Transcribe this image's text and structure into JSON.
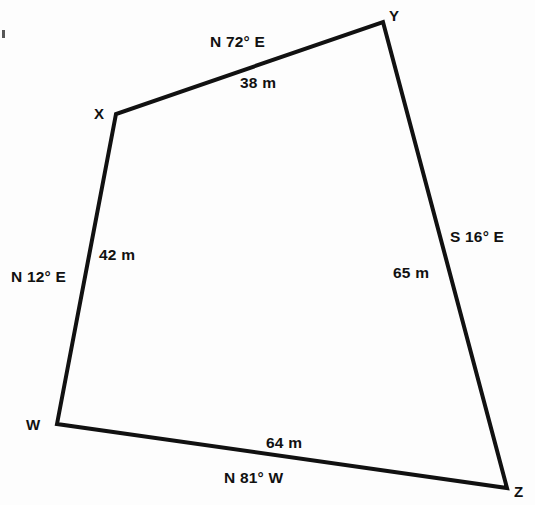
{
  "figure": {
    "background_color": "#fdfdfd",
    "line_color": "#111111",
    "line_width": 4,
    "vertices": [
      {
        "name": "W",
        "label": "W",
        "x": 57,
        "y": 424,
        "label_x": 26,
        "label_y": 417
      },
      {
        "name": "X",
        "label": "X",
        "x": 116,
        "y": 114,
        "label_x": 94,
        "label_y": 106
      },
      {
        "name": "Y",
        "label": "Y",
        "x": 383,
        "y": 22,
        "label_x": 389,
        "label_y": 8
      },
      {
        "name": "Z",
        "label": "Z",
        "x": 507,
        "y": 488,
        "label_x": 514,
        "label_y": 484
      }
    ],
    "edges": [
      {
        "name": "edge-xy",
        "from": "X",
        "to": "Y",
        "bearing": "N 72° E",
        "distance": "38 m",
        "bearing_x": 210,
        "bearing_y": 34,
        "distance_x": 240,
        "distance_y": 75
      },
      {
        "name": "edge-yz",
        "from": "Y",
        "to": "Z",
        "bearing": "S 16° E",
        "distance": "65 m",
        "bearing_x": 450,
        "bearing_y": 229,
        "distance_x": 393,
        "distance_y": 265
      },
      {
        "name": "edge-wz",
        "from": "W",
        "to": "Z",
        "bearing": "N 81° W",
        "distance": "64 m",
        "bearing_x": 224,
        "bearing_y": 470,
        "distance_x": 266,
        "distance_y": 435
      },
      {
        "name": "edge-wx",
        "from": "W",
        "to": "X",
        "bearing": "N 12° E",
        "distance": "42 m",
        "bearing_x": 11,
        "bearing_y": 269,
        "distance_x": 99,
        "distance_y": 247
      }
    ],
    "polygon_points": "57,424 116,114 383,22 507,488"
  }
}
